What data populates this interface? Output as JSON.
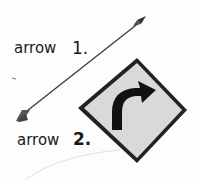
{
  "labels": {
    "arrow1": "arrow",
    "num1": "1.",
    "arrow2": "arrow",
    "num2": "2."
  },
  "figures": {
    "figure1": "feathered-arrow",
    "figure2": "curve-right-road-sign"
  }
}
